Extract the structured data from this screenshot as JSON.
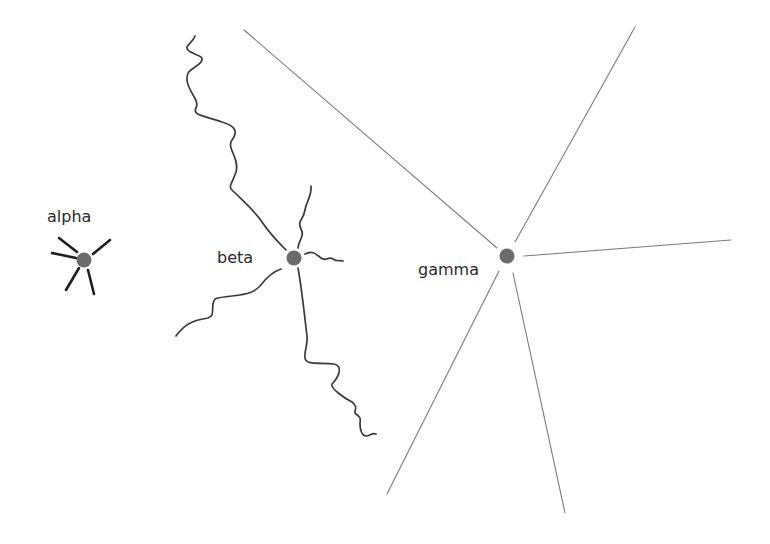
{
  "diagram": {
    "background": "#ffffff",
    "node_color": "#6b6b6b",
    "nodes": [
      {
        "id": "alpha",
        "label": "alpha",
        "center": [
          84,
          260
        ],
        "radius": 7,
        "connection_style": "short thick straight rays",
        "connection_count": 5,
        "connection_color": "#1e1e1e"
      },
      {
        "id": "beta",
        "label": "beta",
        "center": [
          294,
          258
        ],
        "radius": 7,
        "connection_style": "wavy curved lines",
        "connection_count": 5,
        "connection_color": "#3a3a3a"
      },
      {
        "id": "gamma",
        "label": "gamma",
        "center": [
          507,
          256
        ],
        "radius": 7,
        "connection_style": "long thin straight lines",
        "connection_count": 5,
        "connection_color": "#7a7a7a"
      }
    ]
  }
}
